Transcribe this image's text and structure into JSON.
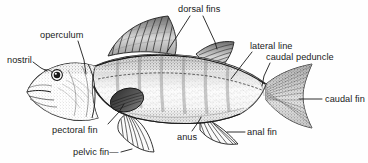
{
  "figure": {
    "style": "black-and-white engraving",
    "background_color": "#fefefe",
    "ink_color": "#1a1a1a"
  },
  "labels": [
    {
      "id": "operculum",
      "text": "operculum",
      "x": 40,
      "y": 30
    },
    {
      "id": "nostril",
      "text": "nostril",
      "x": 7,
      "y": 55
    },
    {
      "id": "dorsal_fins",
      "text": "dorsal fins",
      "x": 178,
      "y": 4
    },
    {
      "id": "lateral_line",
      "text": "lateral line",
      "x": 250,
      "y": 41
    },
    {
      "id": "caudal_peduncle",
      "text": "caudal peduncle",
      "x": 266,
      "y": 52
    },
    {
      "id": "caudal_fin",
      "text": "caudal fin",
      "x": 325,
      "y": 94
    },
    {
      "id": "pectoral_fin",
      "text": "pectoral fin",
      "x": 52,
      "y": 125
    },
    {
      "id": "pelvic_fin",
      "text": "pelvic fin—",
      "x": 73,
      "y": 147
    },
    {
      "id": "anus",
      "text": "anus",
      "x": 177,
      "y": 132
    },
    {
      "id": "anal_fin",
      "text": "anal fin",
      "x": 247,
      "y": 127
    }
  ],
  "leaders": [
    {
      "id": "operculum-leader",
      "points": "78,41 84,60 86,74"
    },
    {
      "id": "nostril-leader",
      "points": "33,62 41,68 47,71"
    },
    {
      "id": "dorsal-fins-leader-1",
      "points": "190,16 172,44 167,52"
    },
    {
      "id": "dorsal-fins-leader-2",
      "points": "203,16 215,42 217,49"
    },
    {
      "id": "lateral-line-leader",
      "points": "252,52 238,70 231,79"
    },
    {
      "id": "caudal-peduncle-leader",
      "points": "270,63 264,76 262,86"
    },
    {
      "id": "caudal-fin-leader",
      "points": "322,99 299,99"
    },
    {
      "id": "pectoral-fin-leader",
      "points": "108,124 119,112 124,104"
    },
    {
      "id": "pelvic-fin-leader",
      "points": "121,152 132,149"
    },
    {
      "id": "anus-leader",
      "points": "192,131 199,121 201,117"
    },
    {
      "id": "anal-fin-leader",
      "points": "245,132 227,132"
    }
  ],
  "parts": [
    {
      "id": "body",
      "name": "fish-body"
    },
    {
      "id": "head",
      "name": "fish-head"
    },
    {
      "id": "eye",
      "name": "fish-eye",
      "cx": 57,
      "cy": 75,
      "r": 5
    },
    {
      "id": "mouth",
      "name": "fish-mouth"
    },
    {
      "id": "operculum-part",
      "name": "operculum-gill-cover"
    },
    {
      "id": "spiny-dorsal",
      "name": "spiny-dorsal-fin"
    },
    {
      "id": "soft-dorsal",
      "name": "soft-dorsal-fin"
    },
    {
      "id": "pectoral",
      "name": "pectoral-fin"
    },
    {
      "id": "pelvic",
      "name": "pelvic-fin"
    },
    {
      "id": "anal",
      "name": "anal-fin"
    },
    {
      "id": "caudal",
      "name": "caudal-fin"
    },
    {
      "id": "lateral-line-part",
      "name": "lateral-line"
    },
    {
      "id": "peduncle",
      "name": "caudal-peduncle"
    }
  ]
}
